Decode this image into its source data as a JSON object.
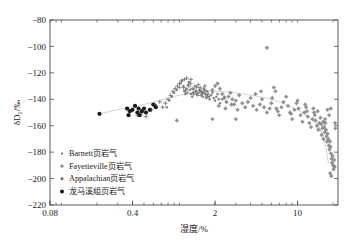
{
  "chart_data": {
    "type": "scatter",
    "title": "",
    "xlabel": "湿度/%",
    "ylabel": "δD₁/‰",
    "xscale": "log",
    "yscale": "linear",
    "xlim": [
      0.08,
      22
    ],
    "ylim": [
      -220,
      -80
    ],
    "xticks": [
      0.08,
      0.4,
      2,
      10
    ],
    "xtick_labels": [
      "0.08",
      "0.4",
      "2",
      "10"
    ],
    "yticks": [
      -80,
      -100,
      -120,
      -140,
      -160,
      -180,
      -200,
      -220
    ],
    "ytick_labels": [
      "−80",
      "−100",
      "−120",
      "−140",
      "−160",
      "−180",
      "−200",
      "−220"
    ],
    "grid": false,
    "legend_position": "lower-left",
    "trendline": {
      "name": "trend",
      "color": "#d8d8d8",
      "points": [
        [
          0.21,
          -151
        ],
        [
          0.33,
          -147
        ],
        [
          0.45,
          -145
        ],
        [
          0.6,
          -142
        ],
        [
          0.8,
          -139
        ],
        [
          1.0,
          -137
        ],
        [
          1.3,
          -135
        ],
        [
          1.7,
          -134
        ],
        [
          2.2,
          -134
        ],
        [
          3.0,
          -135
        ],
        [
          4.0,
          -137
        ],
        [
          5.5,
          -139
        ],
        [
          7.0,
          -142
        ],
        [
          9.0,
          -146
        ],
        [
          11.0,
          -150
        ],
        [
          13.0,
          -155
        ],
        [
          15.0,
          -160
        ],
        [
          16.5,
          -168
        ],
        [
          17.5,
          -178
        ],
        [
          18.2,
          -188
        ]
      ]
    },
    "series": [
      {
        "name": "Barnett页岩气",
        "marker": "dot",
        "color": "#6e6e6e",
        "points": [
          [
            0.78,
            -146
          ],
          [
            0.82,
            -141
          ],
          [
            0.86,
            -138
          ],
          [
            0.9,
            -135
          ],
          [
            0.95,
            -133
          ],
          [
            1.0,
            -131
          ],
          [
            1.02,
            -128
          ],
          [
            1.05,
            -126
          ],
          [
            1.08,
            -130
          ],
          [
            1.1,
            -134
          ],
          [
            1.12,
            -136
          ],
          [
            1.15,
            -132
          ],
          [
            1.18,
            -129
          ],
          [
            1.2,
            -127
          ],
          [
            1.22,
            -133
          ],
          [
            1.25,
            -136
          ],
          [
            1.28,
            -138
          ],
          [
            1.3,
            -135
          ],
          [
            1.32,
            -132
          ],
          [
            1.35,
            -130
          ],
          [
            1.38,
            -134
          ],
          [
            1.4,
            -136
          ],
          [
            1.42,
            -137
          ],
          [
            1.45,
            -135
          ],
          [
            1.48,
            -133
          ],
          [
            1.5,
            -131
          ],
          [
            1.52,
            -134
          ],
          [
            1.55,
            -136
          ],
          [
            1.58,
            -138
          ],
          [
            1.6,
            -135
          ],
          [
            1.62,
            -133
          ],
          [
            1.65,
            -136
          ],
          [
            1.68,
            -139
          ],
          [
            1.7,
            -137
          ],
          [
            1.72,
            -134
          ],
          [
            1.75,
            -136
          ],
          [
            1.78,
            -138
          ],
          [
            1.8,
            -140
          ],
          [
            1.85,
            -137
          ],
          [
            1.9,
            -135
          ],
          [
            1.95,
            -139
          ],
          [
            2.0,
            -141
          ],
          [
            2.05,
            -138
          ],
          [
            2.1,
            -136
          ],
          [
            2.15,
            -140
          ],
          [
            2.2,
            -143
          ],
          [
            2.3,
            -140
          ],
          [
            2.4,
            -138
          ],
          [
            2.5,
            -142
          ]
        ]
      },
      {
        "name": "Fayetteville页岩气",
        "marker": "plus",
        "color": "#7a7a7a",
        "points": [
          [
            0.52,
            -153
          ],
          [
            0.58,
            -148
          ],
          [
            0.62,
            -144
          ],
          [
            0.68,
            -142
          ],
          [
            0.72,
            -146
          ],
          [
            0.76,
            -143
          ],
          [
            0.8,
            -140
          ],
          [
            0.84,
            -137
          ],
          [
            0.88,
            -134
          ],
          [
            0.92,
            -132
          ],
          [
            0.96,
            -130
          ],
          [
            1.0,
            -128
          ],
          [
            1.04,
            -126
          ],
          [
            1.08,
            -131
          ],
          [
            1.12,
            -133
          ],
          [
            1.16,
            -135
          ],
          [
            1.2,
            -130
          ],
          [
            1.24,
            -128
          ],
          [
            1.28,
            -132
          ],
          [
            1.32,
            -136
          ],
          [
            1.36,
            -134
          ],
          [
            1.4,
            -131
          ],
          [
            1.44,
            -129
          ],
          [
            1.48,
            -133
          ],
          [
            1.52,
            -137
          ],
          [
            1.56,
            -135
          ],
          [
            1.6,
            -132
          ],
          [
            1.64,
            -130
          ],
          [
            1.68,
            -134
          ],
          [
            1.72,
            -138
          ],
          [
            0.44,
            -152
          ],
          [
            0.48,
            -150
          ],
          [
            1.1,
            -125
          ],
          [
            1.15,
            -124
          ],
          [
            1.25,
            -125
          ]
        ]
      },
      {
        "name": "Appalachian页岩气",
        "marker": "diamond",
        "color": "#808080",
        "points": [
          [
            1.9,
            -133
          ],
          [
            2.0,
            -130
          ],
          [
            2.1,
            -128
          ],
          [
            2.2,
            -132
          ],
          [
            2.3,
            -136
          ],
          [
            2.4,
            -139
          ],
          [
            2.5,
            -142
          ],
          [
            2.6,
            -138
          ],
          [
            2.7,
            -135
          ],
          [
            2.8,
            -140
          ],
          [
            2.9,
            -144
          ],
          [
            3.0,
            -141
          ],
          [
            3.2,
            -137
          ],
          [
            3.4,
            -143
          ],
          [
            3.6,
            -146
          ],
          [
            3.8,
            -142
          ],
          [
            4.0,
            -139
          ],
          [
            4.2,
            -145
          ],
          [
            4.5,
            -148
          ],
          [
            4.8,
            -144
          ],
          [
            5.0,
            -140
          ],
          [
            5.2,
            -146
          ],
          [
            5.5,
            -150
          ],
          [
            5.8,
            -147
          ],
          [
            6.0,
            -143
          ],
          [
            6.3,
            -131
          ],
          [
            6.5,
            -134
          ],
          [
            6.8,
            -149
          ],
          [
            7.0,
            -152
          ],
          [
            7.3,
            -146
          ],
          [
            7.6,
            -142
          ],
          [
            8.0,
            -138
          ],
          [
            8.3,
            -145
          ],
          [
            8.6,
            -150
          ],
          [
            9.0,
            -155
          ],
          [
            9.4,
            -148
          ],
          [
            9.8,
            -143
          ],
          [
            10.2,
            -147
          ],
          [
            10.6,
            -152
          ],
          [
            11.0,
            -157
          ],
          [
            11.4,
            -150
          ],
          [
            11.8,
            -146
          ],
          [
            12.2,
            -153
          ],
          [
            12.6,
            -158
          ],
          [
            13.0,
            -161
          ],
          [
            13.4,
            -155
          ],
          [
            13.8,
            -150
          ],
          [
            14.2,
            -156
          ],
          [
            14.6,
            -160
          ],
          [
            15.0,
            -163
          ],
          [
            15.3,
            -158
          ],
          [
            15.6,
            -154
          ],
          [
            15.9,
            -159
          ],
          [
            16.2,
            -162
          ],
          [
            16.5,
            -157
          ],
          [
            16.8,
            -161
          ],
          [
            17.0,
            -165
          ],
          [
            17.2,
            -158
          ],
          [
            17.4,
            -163
          ],
          [
            17.6,
            -168
          ],
          [
            17.8,
            -172
          ],
          [
            18.0,
            -166
          ],
          [
            18.2,
            -170
          ],
          [
            18.4,
            -175
          ],
          [
            18.6,
            -178
          ],
          [
            18.8,
            -172
          ],
          [
            19.0,
            -176
          ],
          [
            19.2,
            -181
          ],
          [
            19.4,
            -185
          ],
          [
            19.6,
            -188
          ],
          [
            19.8,
            -183
          ],
          [
            20.0,
            -190
          ],
          [
            20.2,
            -193
          ],
          [
            20.4,
            -186
          ],
          [
            20.6,
            -191
          ],
          [
            18.9,
            -196
          ],
          [
            19.3,
            -198
          ],
          [
            17.9,
            -148
          ],
          [
            18.5,
            -152
          ],
          [
            19.1,
            -147
          ],
          [
            5.5,
            -101
          ],
          [
            3.0,
            -155
          ],
          [
            1.9,
            -155
          ],
          [
            0.95,
            -156
          ],
          [
            2.15,
            -145
          ],
          [
            2.45,
            -147
          ],
          [
            2.75,
            -144
          ],
          [
            3.1,
            -148
          ],
          [
            4.4,
            -136
          ],
          [
            4.9,
            -134
          ],
          [
            6.1,
            -139
          ],
          [
            6.6,
            -147
          ],
          [
            8.8,
            -151
          ],
          [
            10.0,
            -141
          ],
          [
            11.6,
            -144
          ],
          [
            12.0,
            -149
          ],
          [
            13.6,
            -147
          ],
          [
            14.0,
            -152
          ],
          [
            14.8,
            -149
          ],
          [
            16.0,
            -167
          ],
          [
            16.6,
            -170
          ],
          [
            17.1,
            -155
          ],
          [
            20.8,
            -158
          ],
          [
            20.9,
            -162
          ]
        ]
      },
      {
        "name": "龙马溪组页岩气",
        "marker": "filled-circle",
        "color": "#1a1a1a",
        "points": [
          [
            0.21,
            -151
          ],
          [
            0.36,
            -147
          ],
          [
            0.37,
            -152
          ],
          [
            0.38,
            -149
          ],
          [
            0.44,
            -150
          ],
          [
            0.45,
            -147
          ],
          [
            0.46,
            -152
          ],
          [
            0.48,
            -149
          ],
          [
            0.5,
            -147
          ],
          [
            0.52,
            -150
          ],
          [
            0.56,
            -148
          ],
          [
            0.6,
            -144
          ],
          [
            0.63,
            -146
          ],
          [
            0.42,
            -145
          ],
          [
            0.4,
            -148
          ]
        ]
      }
    ]
  },
  "legend": {
    "items": [
      {
        "label": "Barnett页岩气",
        "marker": "dot"
      },
      {
        "label": "Fayetteville页岩气",
        "marker": "plus"
      },
      {
        "label": "Appalachian页岩气",
        "marker": "diamond"
      },
      {
        "label": "龙马溪组页岩气",
        "marker": "filled-circle"
      }
    ]
  },
  "colors": {
    "axis": "#4a4a4a",
    "text": "#1a1a1a",
    "trendline": "#d8d8d8",
    "marker_gray": "#757575",
    "marker_black": "#1a1a1a",
    "background": "#ffffff"
  }
}
